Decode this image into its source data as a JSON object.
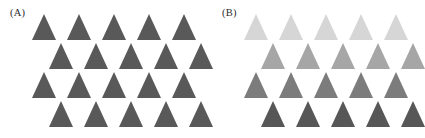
{
  "figure": {
    "width": 423,
    "height": 138,
    "background": "#ffffff"
  },
  "panels": [
    {
      "id": "A",
      "label": "(A)",
      "description": "uniform dark gray triangles",
      "rows": [
        {
          "index": 1,
          "offset": 0,
          "count": 5,
          "color": "#595959"
        },
        {
          "index": 2,
          "offset": 17,
          "count": 5,
          "color": "#595959"
        },
        {
          "index": 3,
          "offset": 0,
          "count": 5,
          "color": "#595959"
        },
        {
          "index": 4,
          "offset": 17,
          "count": 5,
          "color": "#595959"
        }
      ]
    },
    {
      "id": "B",
      "label": "(B)",
      "description": "triangles graded light to dark from top row to bottom row",
      "rows": [
        {
          "index": 1,
          "offset": 0,
          "count": 5,
          "color": "#d6d6d6"
        },
        {
          "index": 2,
          "offset": 17,
          "count": 5,
          "color": "#a6a6a6"
        },
        {
          "index": 3,
          "offset": 0,
          "count": 5,
          "color": "#7c7c7c"
        },
        {
          "index": 4,
          "offset": 17,
          "count": 5,
          "color": "#575757"
        }
      ]
    }
  ],
  "layout": {
    "grid_left": 32,
    "grid_top": 14,
    "column_pitch": 35,
    "row_pitch": 29,
    "triangle_width": 24,
    "triangle_height": 26
  }
}
